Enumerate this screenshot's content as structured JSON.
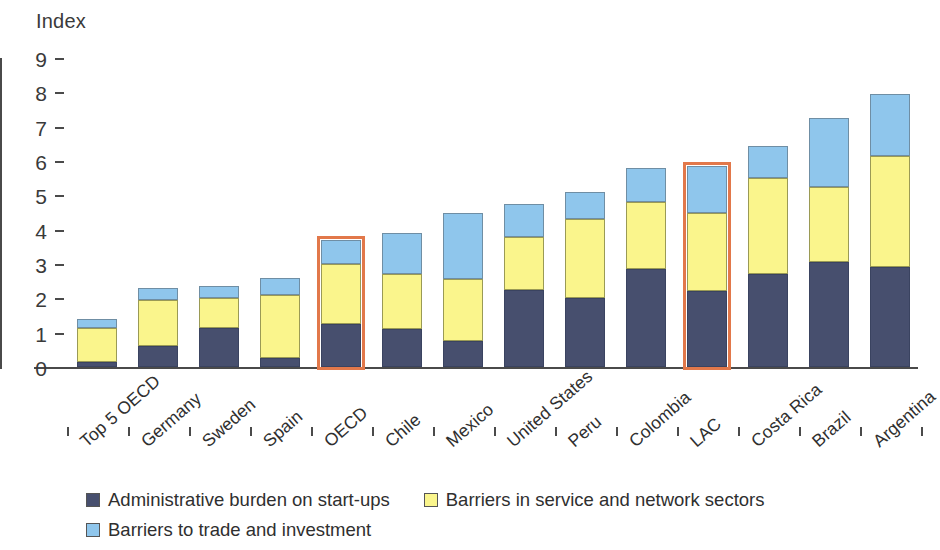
{
  "chart_data": {
    "type": "bar",
    "subtype": "stacked-bar",
    "title": "",
    "ylabel": "Index",
    "xlabel": "",
    "ylim": [
      0,
      9
    ],
    "yticks": [
      0,
      1,
      2,
      3,
      4,
      5,
      6,
      7,
      8,
      9
    ],
    "ytick_labels": [
      "0",
      "1",
      "2",
      "3",
      "4",
      "5",
      "6",
      "7",
      "8",
      "9"
    ],
    "grid": false,
    "legend_position": "bottom",
    "categories": [
      "Top 5 OECD",
      "Germany",
      "Sweden",
      "Spain",
      "OECD",
      "Chile",
      "Mexico",
      "United States",
      "Peru",
      "Colombia",
      "LAC",
      "Costa Rica",
      "Brazil",
      "Argentina"
    ],
    "series": [
      {
        "name": "Administrative burden on start-ups",
        "color": "#474F6E",
        "values": [
          0.15,
          0.6,
          1.15,
          0.25,
          1.25,
          1.1,
          0.75,
          2.25,
          2.0,
          2.85,
          2.2,
          2.7,
          3.05,
          2.9
        ]
      },
      {
        "name": "Barriers in service and network sectors",
        "color": "#FAF58C",
        "values": [
          1.0,
          1.35,
          0.85,
          1.85,
          1.75,
          1.6,
          1.8,
          1.55,
          2.3,
          1.95,
          2.3,
          2.8,
          2.2,
          3.25
        ]
      },
      {
        "name": "Barriers to trade and investment",
        "color": "#8FC6EC",
        "values": [
          0.25,
          0.35,
          0.35,
          0.5,
          0.7,
          1.2,
          1.95,
          0.95,
          0.8,
          1.0,
          1.35,
          0.95,
          2.0,
          1.8
        ]
      }
    ],
    "totals": [
      1.4,
      2.3,
      2.35,
      2.6,
      3.7,
      3.9,
      4.5,
      4.75,
      5.1,
      5.8,
      5.85,
      6.45,
      7.25,
      7.95
    ],
    "highlighted_categories": [
      "OECD",
      "LAC"
    ],
    "highlight_color": "#E2784A",
    "legend": [
      {
        "label": "Administrative burden on start-ups",
        "color": "#474F6E"
      },
      {
        "label": "Barriers in service and network sectors",
        "color": "#FAF58C"
      },
      {
        "label": "Barriers to trade and investment",
        "color": "#8FC6EC"
      }
    ]
  }
}
